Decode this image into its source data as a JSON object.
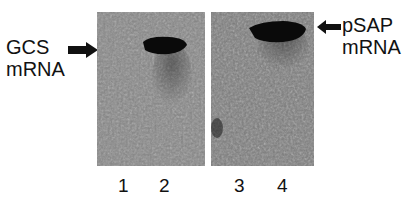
{
  "figure": {
    "left_label": {
      "line1": "GCS",
      "line2": "mRNA"
    },
    "right_label": {
      "line1": "pSAP",
      "line2": "mRNA"
    },
    "lanes": [
      "1",
      "2",
      "3",
      "4"
    ],
    "colors": {
      "background": "#ffffff",
      "gel": "#7d7d7d",
      "band": "#0a0a0a",
      "text": "#111111"
    }
  }
}
